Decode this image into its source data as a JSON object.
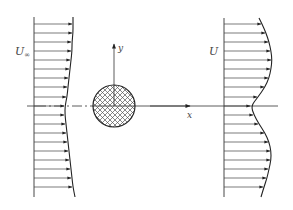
{
  "diagram": {
    "labels": {
      "upstream_velocity": "U∞",
      "upstream_velocity_base": "U",
      "upstream_velocity_sub": "∞",
      "downstream_velocity": "U",
      "x_axis": "x",
      "y_axis": "y"
    },
    "colors": {
      "line": "#333333",
      "label": "#444444",
      "hatch": "#555555",
      "background": "#ffffff"
    },
    "upstream_profile": {
      "baseline_x": 34,
      "y_top": 17,
      "y_bottom": 197,
      "arrow_ys": [
        24,
        33,
        42,
        51,
        60,
        69,
        78,
        87,
        97,
        106,
        115,
        124,
        133,
        142,
        151,
        160,
        169,
        178,
        187
      ],
      "arrow_tips": [
        72,
        72,
        71,
        71,
        70,
        69,
        68,
        67,
        66,
        64,
        64,
        65,
        66,
        67,
        68,
        69,
        70,
        71,
        72
      ]
    },
    "downstream_profile": {
      "baseline_x": 224,
      "y_top": 18,
      "y_bottom": 197,
      "arrow_ys": [
        24,
        33,
        42,
        51,
        60,
        69,
        78,
        87,
        97,
        106,
        115,
        124,
        133,
        142,
        151,
        160,
        169,
        178,
        187
      ],
      "arrow_tips": [
        261,
        265,
        268,
        270,
        271,
        270,
        268,
        264,
        257,
        250,
        253,
        258,
        264,
        268,
        270,
        270,
        268,
        266,
        263
      ]
    },
    "cylinder": {
      "cx": 114,
      "cy": 106,
      "r": 21
    },
    "axes": {
      "origin_x": 114,
      "origin_y": 106,
      "x_axis_end": 278,
      "x_axis_start": 27,
      "y_axis_top": 44
    }
  }
}
